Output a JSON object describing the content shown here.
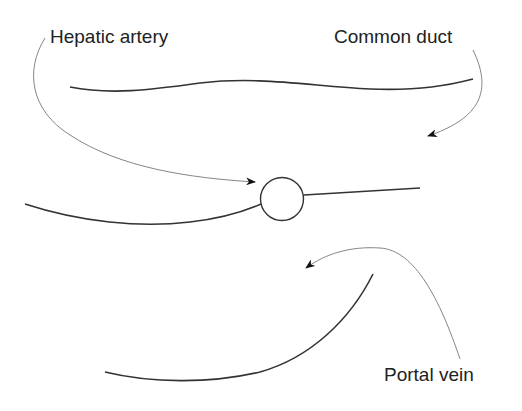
{
  "diagram": {
    "labels": {
      "hepatic_artery": "Hepatic artery",
      "common_duct": "Common duct",
      "portal_vein": "Portal vein"
    },
    "colors": {
      "stroke": "#333333",
      "pointer": "#777777",
      "text": "#222222",
      "background": "#ffffff"
    }
  }
}
